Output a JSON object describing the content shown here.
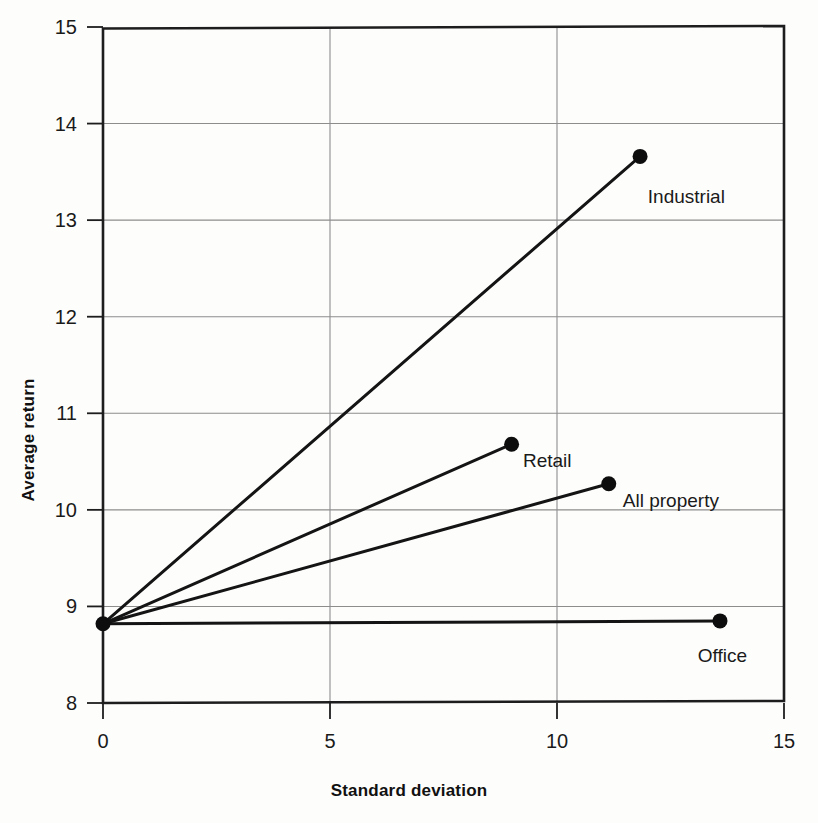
{
  "chart_data": {
    "type": "scatter",
    "title": "",
    "xlabel": "Standard deviation",
    "ylabel": "Average return",
    "xlim": [
      0,
      15
    ],
    "ylim": [
      8,
      15
    ],
    "xticks": [
      "0",
      "5",
      "10",
      "15"
    ],
    "xtick_values": [
      0,
      5,
      10,
      15
    ],
    "yticks": [
      "8",
      "9",
      "10",
      "11",
      "12",
      "13",
      "14",
      "15"
    ],
    "ytick_values": [
      8,
      9,
      10,
      11,
      12,
      13,
      14,
      15
    ],
    "grid": true,
    "legend": "none",
    "origin": {
      "x": 0,
      "y": 8.82
    },
    "series": [
      {
        "name": "Industrial",
        "x": 11.83,
        "y": 13.66,
        "label": "Industrial",
        "label_x": 12.0,
        "label_y": 13.25
      },
      {
        "name": "Retail",
        "x": 9.0,
        "y": 10.68,
        "label": "Retail",
        "label_x": 9.25,
        "label_y": 10.52
      },
      {
        "name": "All property",
        "x": 11.14,
        "y": 10.27,
        "label": "All property",
        "label_x": 11.45,
        "label_y": 10.1
      },
      {
        "name": "Office",
        "x": 13.59,
        "y": 8.85,
        "label": "Office",
        "label_x": 13.1,
        "label_y": 8.5
      }
    ]
  },
  "axes": {
    "x_axis_label": "Standard deviation",
    "y_axis_label": "Average return"
  },
  "labels": {
    "industrial": "Industrial",
    "retail": "Retail",
    "all_property": "All property",
    "office": "Office"
  },
  "colors": {
    "line": "#141414",
    "grid": "#8d8d8d",
    "frame": "#1d1d1d",
    "text": "#1a1a1a",
    "background": "#fdfdfc"
  }
}
